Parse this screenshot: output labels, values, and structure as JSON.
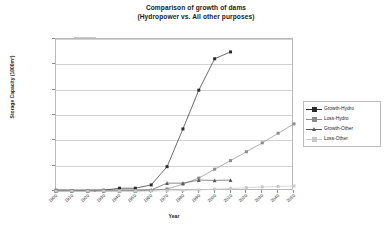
{
  "chart_data": {
    "type": "line",
    "title": "Comparison of growth of dams",
    "subtitle": "(Hydropower vs. All other purposes)",
    "xlabel": "Year",
    "ylabel": "Storage Capacity (1000m³)",
    "x": [
      1900,
      1910,
      1920,
      1930,
      1940,
      1950,
      1960,
      1970,
      1980,
      1990,
      2000,
      2010,
      2020,
      2030,
      2040,
      2050
    ],
    "categories": [
      "1900",
      "1910",
      "1920",
      "1930",
      "1940",
      "1950",
      "1960",
      "1970",
      "1980",
      "1990",
      "2000",
      "2010",
      "2020",
      "2030",
      "2040",
      "2050"
    ],
    "xlim": [
      1900,
      2050
    ],
    "ylim": [
      0,
      600000000
    ],
    "yticks": [
      0,
      100000000,
      200000000,
      300000000,
      400000000,
      500000000,
      600000000
    ],
    "ytick_labels": [
      "0",
      "100000000",
      "200000000",
      "300000000",
      "400000000",
      "500000000",
      "600000000"
    ],
    "grid": "horizontal",
    "legend_position": "right",
    "series": [
      {
        "name": "Growth-Hydro",
        "marker": "square",
        "color": "#2b2b2b",
        "values": [
          3000000,
          2000000,
          2000000,
          3000000,
          11000000,
          11000000,
          24000000,
          96000000,
          245000000,
          398000000,
          522000000,
          549000000,
          null,
          null,
          null,
          null
        ]
      },
      {
        "name": "Loss-Hydro",
        "marker": "square",
        "color": "#8c8c8c",
        "values": [
          0,
          0,
          0,
          0,
          0,
          0,
          2000000,
          8000000,
          27000000,
          51000000,
          86000000,
          120000000,
          155000000,
          190000000,
          228000000,
          265000000
        ]
      },
      {
        "name": "Growth-Other",
        "marker": "triangle",
        "color": "#5a5a5a",
        "values": [
          1000000,
          1000000,
          1000000,
          1000000,
          2000000,
          2000000,
          4000000,
          31000000,
          31000000,
          43000000,
          42000000,
          43000000,
          null,
          null,
          null,
          null
        ]
      },
      {
        "name": "Loss-Other",
        "marker": "square",
        "color": "#c9c9c9",
        "values": [
          0,
          0,
          0,
          0,
          0,
          0,
          0,
          1000000,
          2000000,
          4000000,
          7000000,
          10000000,
          13000000,
          16000000,
          18000000,
          20000000
        ]
      }
    ]
  }
}
